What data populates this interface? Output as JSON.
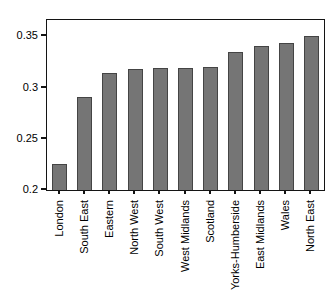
{
  "chart_data": {
    "type": "bar",
    "title": "",
    "xlabel": "",
    "ylabel": "",
    "categories": [
      "London",
      "South East",
      "Eastern",
      "North West",
      "South West",
      "West Midlands",
      "Scotland",
      "Yorks-Humberside",
      "East Midlands",
      "Wales",
      "North East"
    ],
    "values": [
      0.225,
      0.291,
      0.314,
      0.318,
      0.319,
      0.319,
      0.32,
      0.335,
      0.341,
      0.344,
      0.35
    ],
    "ylim": [
      0.2,
      0.366
    ],
    "yticks": [
      0.2,
      0.25,
      0.3,
      0.35
    ],
    "ytick_labels": [
      "0.2",
      "0.25",
      "0.3",
      "0.35"
    ],
    "grid": false,
    "legend_position": "none",
    "bar_color": "#757575",
    "bar_border_color": "#444444",
    "axis_color": "#141414",
    "text_color": "#000000",
    "background_color": "#ffffff"
  }
}
